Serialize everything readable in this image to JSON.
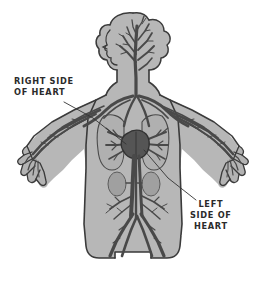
{
  "diagram": {
    "style": "hand-drawn grayscale illustration",
    "background_color": "#ffffff",
    "body_fill_color": "#b3b3b3",
    "body_outline_color": "#3a3a3a",
    "vessel_color": "#4a4a4a",
    "heart_color": "#5a5a5a",
    "organ_fill_color": "#a0a0a0",
    "label_color": "#2b2b2b",
    "leader_line_color": "#333333"
  },
  "labels": {
    "right_side": {
      "line1": "RIGHT SIDE",
      "line2": "OF HEART"
    },
    "left_side": {
      "line1": "LEFT",
      "line2": "SIDE OF",
      "line3": "HEART"
    }
  },
  "anatomy": {
    "parts": [
      "head",
      "hair",
      "neck",
      "torso",
      "left-arm",
      "right-arm",
      "left-hand",
      "right-hand",
      "lungs",
      "heart",
      "kidneys",
      "aorta",
      "legs"
    ]
  }
}
